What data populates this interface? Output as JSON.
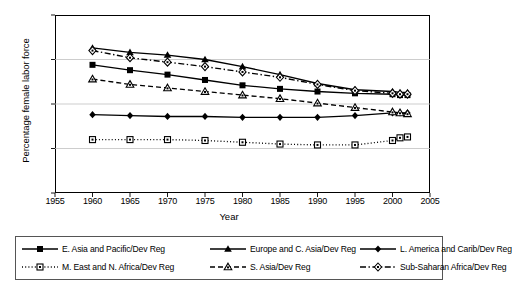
{
  "chart_data": {
    "type": "line",
    "title": "",
    "xlabel": "Year",
    "ylabel": "Percentage female labor force",
    "xlim": [
      1955,
      2005
    ],
    "ylim": [
      0.0,
      2.0
    ],
    "xticks": [
      1955,
      1960,
      1965,
      1970,
      1975,
      1980,
      1985,
      1990,
      1995,
      2000,
      2005
    ],
    "yticks": [
      "0.0",
      "0.5",
      "1.0",
      "1.5",
      "2.0"
    ],
    "grid": "horizontal",
    "legend_position": "below-outside",
    "x": [
      1960,
      1965,
      1970,
      1975,
      1980,
      1985,
      1990,
      1995,
      2000,
      2001,
      2002
    ],
    "series": [
      {
        "name": "E. Asia and Pacific/Dev Reg",
        "marker": "filled-square",
        "line": "solid",
        "values": [
          1.44,
          1.38,
          1.33,
          1.27,
          1.21,
          1.17,
          1.14,
          1.12,
          1.11,
          1.1,
          1.1
        ]
      },
      {
        "name": "Europe and C. Asia/Dev Reg",
        "marker": "filled-triangle",
        "line": "solid",
        "values": [
          1.63,
          1.58,
          1.55,
          1.5,
          1.42,
          1.33,
          1.23,
          1.16,
          1.14,
          1.13,
          1.13
        ]
      },
      {
        "name": "L. America and Carib/Dev Reg",
        "marker": "filled-diamond",
        "line": "solid",
        "values": [
          0.88,
          0.87,
          0.86,
          0.86,
          0.85,
          0.85,
          0.85,
          0.87,
          0.9,
          0.9,
          0.9
        ]
      },
      {
        "name": "M. East and N. Africa/Dev Reg",
        "marker": "open-square",
        "line": "dotted",
        "values": [
          0.6,
          0.6,
          0.6,
          0.59,
          0.57,
          0.55,
          0.54,
          0.54,
          0.59,
          0.62,
          0.63
        ]
      },
      {
        "name": "S. Asia/Dev Reg",
        "marker": "open-triangle",
        "line": "dashed",
        "values": [
          1.28,
          1.22,
          1.18,
          1.14,
          1.1,
          1.06,
          1.01,
          0.96,
          0.91,
          0.9,
          0.89
        ]
      },
      {
        "name": "Sub-Saharan Africa/Dev Reg",
        "marker": "open-diamond",
        "line": "dash-dot",
        "values": [
          1.6,
          1.52,
          1.47,
          1.42,
          1.36,
          1.3,
          1.22,
          1.15,
          1.12,
          1.11,
          1.11
        ]
      }
    ]
  },
  "legend": {
    "rows": [
      [
        "E. Asia and Pacific/Dev Reg",
        "Europe and C. Asia/Dev Reg",
        "L. America and Carib/Dev Reg"
      ],
      [
        "M. East and N. Africa/Dev Reg",
        "S. Asia/Dev Reg",
        "Sub-Saharan Africa/Dev Reg"
      ]
    ]
  },
  "colors": {
    "line": "#000000",
    "grid": "#c0c0c0",
    "axis": "#000000",
    "background": "#ffffff"
  }
}
